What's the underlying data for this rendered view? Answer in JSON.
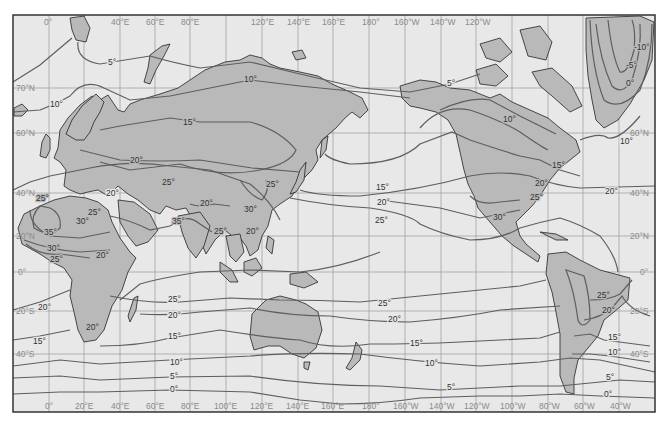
{
  "map": {
    "title": "",
    "type": "world isotherm map (mean sea-level temperature, °C)",
    "colors": {
      "ocean": "#e8e8e8",
      "land": "#b9b9b9",
      "isotherm": "#5e5e5e",
      "grid": "#9a9a9a",
      "frame": "#333333"
    },
    "longitude_labels_top": [
      "0°",
      "40°E",
      "60°E",
      "80°E",
      "120°E",
      "140°E",
      "160°E",
      "180°",
      "160°W",
      "140°W",
      "120°W"
    ],
    "longitude_labels_bottom": [
      "0°",
      "20°E",
      "40°E",
      "60°E",
      "80°E",
      "100°E",
      "120°E",
      "140°E",
      "160°E",
      "180°",
      "160°W",
      "140°W",
      "120°W",
      "100°W",
      "80°W",
      "60°W",
      "40°W"
    ],
    "latitude_labels_left": [
      "70°N",
      "60°N",
      "40°N",
      "20°N",
      "0°",
      "20°S",
      "40°S"
    ],
    "latitude_labels_right": [
      "60°N",
      "40°N",
      "20°N",
      "0°",
      "20°S",
      "40°S"
    ],
    "isotherm_labels": {
      "north_atlantic_5": "5°",
      "scandinavia_10": "10°",
      "siberia_15": "15°",
      "siberia_10": "10°",
      "alaska_5": "5°",
      "canada_10": "10°",
      "greenland_0": "0°",
      "greenland_5": "-5°",
      "greenland_10": "-10°",
      "greenland_east_0": "0°",
      "greenland_south_10": "10°",
      "europe_20": "20°",
      "iberia_25": "25°",
      "turkey_20": "20°",
      "caspian_25": "25°",
      "med_25": "25°",
      "sahara_30": "30°",
      "sahara_35": "35°",
      "sahel_30": "30°",
      "sahel_25": "25°",
      "eastafrica_20": "20°",
      "india_35": "35°",
      "tibet_20": "20°",
      "seasia_25": "25°",
      "china_25": "25°",
      "china_30": "30°",
      "asia_20": "20°",
      "pacific_15": "15°",
      "pacific_20": "20°",
      "pacific_25": "25°",
      "na_15": "15°",
      "na_20": "20°",
      "na_25": "25°",
      "mexico_30": "30°",
      "atlantic_20": "20°",
      "s_atl_west_20": "20°",
      "s_africa_20": "20°",
      "s_atl_15": "15°",
      "indian_25": "25°",
      "indian_20": "20°",
      "indian_15": "15°",
      "south_10": "10°",
      "south_5": "5°",
      "south_0": "0°",
      "pac_s_25": "25°",
      "pac_s_20": "20°",
      "pac_s_15": "15°",
      "pac_s_10": "10°",
      "pac_s_5": "5°",
      "sa_25": "25°",
      "sa_20": "20°",
      "sa_15": "15°",
      "sa_10": "10°",
      "sa_5": "5°",
      "sa_0": "0°"
    }
  }
}
